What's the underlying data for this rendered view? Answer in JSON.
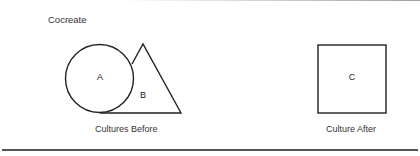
{
  "title": "Cocreate",
  "before": {
    "caption": "Cultures Before",
    "shapes": [
      {
        "type": "circle",
        "label": "A"
      },
      {
        "type": "triangle",
        "label": "B"
      }
    ]
  },
  "after": {
    "caption": "Culture After",
    "shapes": [
      {
        "type": "square",
        "label": "C"
      }
    ]
  },
  "colors": {
    "stroke": "#222222",
    "text": "#333333",
    "background": "#ffffff"
  }
}
